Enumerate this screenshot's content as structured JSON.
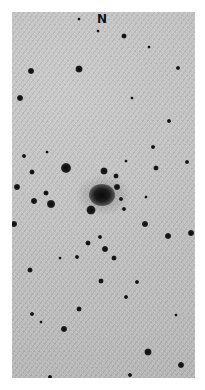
{
  "image": {
    "description": "Inverted-contrast astronomical star field with a central diffuse galaxy",
    "background_color": "#bdbdbd",
    "star_color": "#111111",
    "orientation_label": "N"
  },
  "galaxy": {
    "x": 102,
    "y": 195,
    "w": 26,
    "h": 22
  },
  "stars": [
    {
      "x": 31,
      "y": 71,
      "r": 6
    },
    {
      "x": 79,
      "y": 69,
      "r": 7
    },
    {
      "x": 124,
      "y": 36,
      "r": 5
    },
    {
      "x": 20,
      "y": 98,
      "r": 6
    },
    {
      "x": 178,
      "y": 68,
      "r": 4
    },
    {
      "x": 98,
      "y": 31,
      "r": 3
    },
    {
      "x": 79,
      "y": 19,
      "r": 3
    },
    {
      "x": 132,
      "y": 98,
      "r": 3
    },
    {
      "x": 169,
      "y": 121,
      "r": 4
    },
    {
      "x": 149,
      "y": 47,
      "r": 3
    },
    {
      "x": 66,
      "y": 168,
      "r": 10
    },
    {
      "x": 104,
      "y": 171,
      "r": 7
    },
    {
      "x": 116,
      "y": 176,
      "r": 5
    },
    {
      "x": 117,
      "y": 187,
      "r": 6
    },
    {
      "x": 121,
      "y": 199,
      "r": 4
    },
    {
      "x": 124,
      "y": 209,
      "r": 4
    },
    {
      "x": 91,
      "y": 210,
      "r": 9
    },
    {
      "x": 51,
      "y": 204,
      "r": 8
    },
    {
      "x": 34,
      "y": 201,
      "r": 6
    },
    {
      "x": 46,
      "y": 193,
      "r": 5
    },
    {
      "x": 17,
      "y": 187,
      "r": 6
    },
    {
      "x": 32,
      "y": 172,
      "r": 5
    },
    {
      "x": 24,
      "y": 156,
      "r": 4
    },
    {
      "x": 47,
      "y": 152,
      "r": 3
    },
    {
      "x": 14,
      "y": 224,
      "r": 6
    },
    {
      "x": 126,
      "y": 161,
      "r": 3
    },
    {
      "x": 156,
      "y": 168,
      "r": 5
    },
    {
      "x": 187,
      "y": 162,
      "r": 4
    },
    {
      "x": 153,
      "y": 147,
      "r": 4
    },
    {
      "x": 145,
      "y": 224,
      "r": 6
    },
    {
      "x": 168,
      "y": 236,
      "r": 6
    },
    {
      "x": 191,
      "y": 233,
      "r": 6
    },
    {
      "x": 105,
      "y": 249,
      "r": 6
    },
    {
      "x": 114,
      "y": 258,
      "r": 5
    },
    {
      "x": 88,
      "y": 243,
      "r": 5
    },
    {
      "x": 100,
      "y": 237,
      "r": 4
    },
    {
      "x": 77,
      "y": 257,
      "r": 4
    },
    {
      "x": 60,
      "y": 258,
      "r": 3
    },
    {
      "x": 89,
      "y": 211,
      "r": 3
    },
    {
      "x": 146,
      "y": 197,
      "r": 3
    },
    {
      "x": 30,
      "y": 270,
      "r": 5
    },
    {
      "x": 101,
      "y": 281,
      "r": 5
    },
    {
      "x": 137,
      "y": 282,
      "r": 4
    },
    {
      "x": 126,
      "y": 297,
      "r": 4
    },
    {
      "x": 79,
      "y": 309,
      "r": 5
    },
    {
      "x": 32,
      "y": 314,
      "r": 4
    },
    {
      "x": 64,
      "y": 329,
      "r": 6
    },
    {
      "x": 148,
      "y": 352,
      "r": 7
    },
    {
      "x": 181,
      "y": 365,
      "r": 6
    },
    {
      "x": 130,
      "y": 375,
      "r": 4
    },
    {
      "x": 50,
      "y": 377,
      "r": 4
    },
    {
      "x": 176,
      "y": 315,
      "r": 3
    },
    {
      "x": 41,
      "y": 322,
      "r": 3
    }
  ]
}
